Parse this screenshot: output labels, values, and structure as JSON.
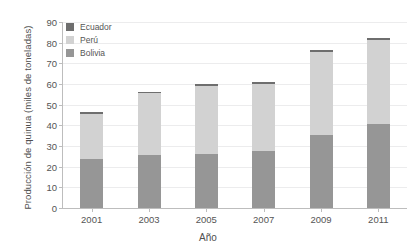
{
  "chart_data": {
    "type": "bar",
    "stacked": true,
    "title": "",
    "xlabel": "Año",
    "ylabel": "Producción de quinua (miles de toneladas)",
    "categories": [
      "2001",
      "2003",
      "2005",
      "2007",
      "2009",
      "2011"
    ],
    "series": [
      {
        "name": "Bolivia",
        "color": "#969696",
        "values": [
          23.5,
          25.5,
          26.0,
          27.5,
          35.5,
          40.5
        ]
      },
      {
        "name": "Perú",
        "color": "#d2d2d2",
        "values": [
          22.0,
          30.0,
          33.0,
          32.5,
          40.0,
          41.0
        ]
      },
      {
        "name": "Ecuador",
        "color": "#6e6e6e",
        "values": [
          0.8,
          0.8,
          0.8,
          0.8,
          0.8,
          0.8
        ]
      }
    ],
    "totals": [
      46.3,
      56.3,
      59.8,
      60.8,
      76.3,
      82.3
    ],
    "ylim": [
      0,
      90
    ],
    "yticks": [
      0,
      10,
      20,
      30,
      40,
      50,
      60,
      70,
      80,
      90
    ],
    "ytick_labels": [
      "0",
      "10",
      "20",
      "30",
      "40",
      "50",
      "60",
      "70",
      "80",
      "90"
    ],
    "grid": true,
    "legend_position": "top-left",
    "legend_order": [
      "Ecuador",
      "Perú",
      "Bolivia"
    ]
  },
  "legend": {
    "items": [
      {
        "label": "Ecuador",
        "color": "#6e6e6e"
      },
      {
        "label": "Perú",
        "color": "#d2d2d2"
      },
      {
        "label": "Bolivia",
        "color": "#969696"
      }
    ]
  },
  "axes": {
    "y_title": "Producción de quinua (miles de toneladas)",
    "x_title": "Año"
  }
}
